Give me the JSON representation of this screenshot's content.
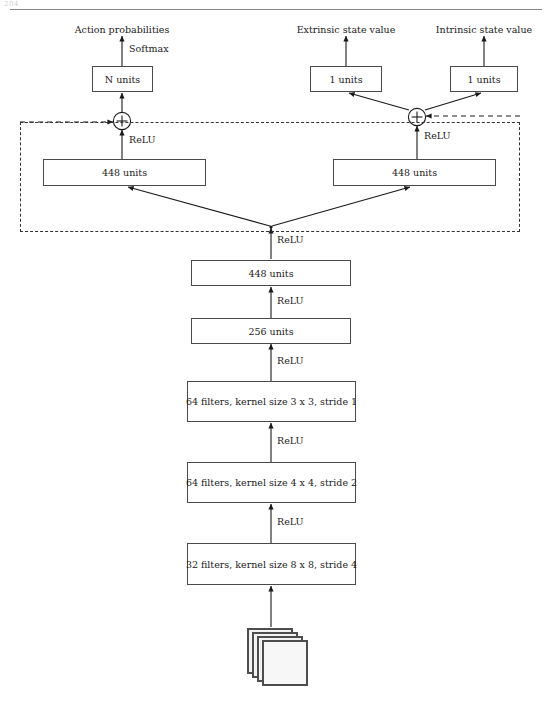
{
  "page": {
    "corner_mark": "204",
    "caption_rule": "horizontal-rule"
  },
  "outputs": {
    "action_probabilities": "Action probabilities",
    "extrinsic_state_value": "Extrinsic state value",
    "intrinsic_state_value": "Intrinsic state value"
  },
  "activations": {
    "softmax": "Softmax",
    "relu": "ReLU"
  },
  "heads": {
    "policy_head": "N units",
    "extrinsic_head": "1 units",
    "intrinsic_head": "1 units"
  },
  "residual_block": {
    "left_fc": "448 units",
    "right_fc": "448 units"
  },
  "trunk": {
    "fc2": "448 units",
    "fc1": "256 units",
    "conv3": "64 filters, kernel size 3 x 3, stride 1",
    "conv2": "64 filters, kernel size 4 x 4, stride 2",
    "conv1": "32 filters, kernel size 8 x 8, stride 4"
  },
  "operators": {
    "add_left": "+",
    "add_right": "+"
  },
  "input": {
    "frame_count": 4,
    "description": "stacked input frames"
  },
  "relu_labels": {
    "r_left_block": "ReLU",
    "r_right_block": "ReLU",
    "r_split": "ReLU",
    "r_fc2": "ReLU",
    "r_fc1": "ReLU",
    "r_conv3": "ReLU",
    "r_conv2": "ReLU"
  },
  "colors": {
    "box_border": "#4a4a4a",
    "dashed_border": "#333333",
    "arrow": "#1a1a1a",
    "frame_fill": "#f2f2f2",
    "rule": "#8a8a8a"
  }
}
